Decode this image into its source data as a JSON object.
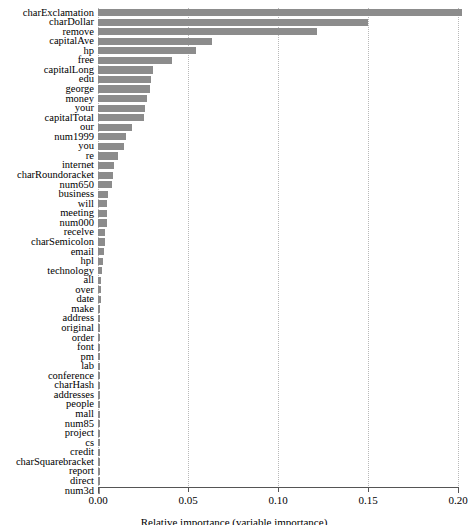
{
  "chart_data": {
    "type": "bar",
    "orientation": "horizontal",
    "title": "",
    "xlabel": "Relative importance (variable importance)",
    "ylabel": "",
    "xlim": [
      0.0,
      0.2
    ],
    "xticks": [
      "0.00",
      "0.05",
      "0.10",
      "0.15",
      "0.20"
    ],
    "xtick_values": [
      0.0,
      0.05,
      0.1,
      0.15,
      0.2
    ],
    "grid": "vertical-dotted",
    "legend": "none",
    "bar_color": "#8c8c8c",
    "categories": [
      "charExclamation",
      "charDollar",
      "remove",
      "capitalAve",
      "hp",
      "free",
      "capitalLong",
      "edu",
      "george",
      "money",
      "your",
      "capitalTotal",
      "our",
      "num1999",
      "you",
      "re",
      "internet",
      "charRoundoracket",
      "num650",
      "business",
      "will",
      "meeting",
      "num000",
      "recelve",
      "charSemicolon",
      "email",
      "hpl",
      "technology",
      "all",
      "over",
      "date",
      "make",
      "address",
      "original",
      "order",
      "font",
      "pm",
      "lab",
      "conference",
      "charHash",
      "addresses",
      "people",
      "mall",
      "num85",
      "project",
      "cs",
      "credit",
      "charSquarebracket",
      "report",
      "direct",
      "num3d"
    ],
    "values": [
      0.2022,
      0.15,
      0.1217,
      0.0633,
      0.0544,
      0.0411,
      0.0306,
      0.0294,
      0.0289,
      0.0272,
      0.0261,
      0.0256,
      0.0189,
      0.0156,
      0.0144,
      0.0111,
      0.0089,
      0.0083,
      0.0078,
      0.0056,
      0.005,
      0.005,
      0.005,
      0.0039,
      0.0039,
      0.0033,
      0.0028,
      0.0022,
      0.0017,
      0.0014,
      0.0014,
      0.0012,
      0.0011,
      0.0011,
      0.001,
      0.001,
      0.0009,
      0.0009,
      0.0008,
      0.0008,
      0.0007,
      0.0007,
      0.0006,
      0.0006,
      0.0006,
      0.0005,
      0.0005,
      0.0004,
      0.0004,
      0.0003,
      0.0003
    ]
  }
}
